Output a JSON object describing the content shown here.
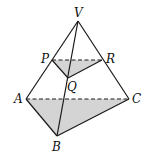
{
  "figure": {
    "type": "pyramid-with-cross-section",
    "points": {
      "V": {
        "label": "V",
        "x": 78,
        "y": 21
      },
      "P": {
        "label": "P",
        "x": 52,
        "y": 60
      },
      "R": {
        "label": "R",
        "x": 102,
        "y": 60
      },
      "Q": {
        "label": "Q",
        "x": 68,
        "y": 78
      },
      "A": {
        "label": "A",
        "x": 26,
        "y": 99
      },
      "C": {
        "label": "C",
        "x": 129,
        "y": 99
      },
      "B": {
        "label": "B",
        "x": 57,
        "y": 136
      }
    },
    "shaded_faces": [
      "PQR",
      "ABC"
    ],
    "dashed_edges": [
      "PR",
      "AC"
    ],
    "solid_edges": [
      "VA",
      "VB",
      "VC",
      "AB",
      "BC",
      "PQ",
      "QR"
    ],
    "shade_color": "#d4d4d4",
    "line_color": "#1a1a1a"
  }
}
